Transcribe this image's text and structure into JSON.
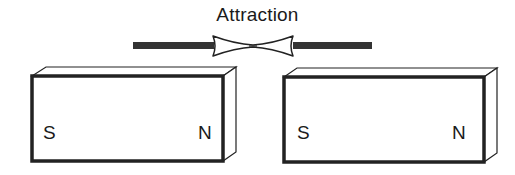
{
  "diagram": {
    "title": "Attraction",
    "colors": {
      "ink": "#222222",
      "bar": "#333333",
      "background": "#ffffff"
    },
    "connector": {
      "type": "pinched-link",
      "left_bar": {
        "x1": 133,
        "x2": 214
      },
      "right_bar": {
        "x1": 293,
        "x2": 372
      }
    },
    "magnets": [
      {
        "id": "left-magnet",
        "poles": {
          "left": "S",
          "right": "N"
        }
      },
      {
        "id": "right-magnet",
        "poles": {
          "left": "S",
          "right": "N"
        }
      }
    ]
  }
}
